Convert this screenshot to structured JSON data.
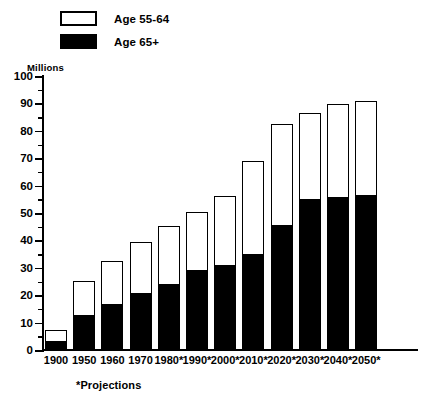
{
  "chart_data": {
    "type": "bar",
    "stacked": true,
    "title": "",
    "subtitle": "",
    "xlabel": "",
    "ylabel": "Millions",
    "ylim": [
      0,
      100
    ],
    "ytick_step": 10,
    "yminor_step": 5,
    "grid": false,
    "legend_position": "top-left",
    "footnote": "*Projections",
    "categories": [
      "1900",
      "1950",
      "1960",
      "1970",
      "1980*",
      "1990*",
      "2000*",
      "2010*",
      "2020*",
      "2030*",
      "2040*",
      "2050*"
    ],
    "series": [
      {
        "name": "Age 65+",
        "color": "#000000",
        "values": [
          3,
          12.5,
          16.5,
          20.5,
          24,
          29,
          31,
          35,
          45.5,
          55,
          55.5,
          56.5
        ]
      },
      {
        "name": "Age 55-64",
        "color": "#ffffff",
        "values": [
          4,
          12.5,
          15.5,
          18.5,
          21,
          21,
          25,
          33.5,
          36.5,
          31,
          34,
          34
        ]
      }
    ],
    "totals": [
      7,
      25,
      32,
      39,
      45,
      50,
      56,
      68.5,
      82,
      86,
      89.5,
      90.5
    ],
    "ytick_labels": [
      "0",
      "10",
      "20",
      "30",
      "40",
      "50",
      "60",
      "70",
      "80",
      "90",
      "100"
    ]
  },
  "legend": {
    "items": [
      {
        "label": "Age 55-64",
        "style": "hollow"
      },
      {
        "label": "Age 65+",
        "style": "filled"
      }
    ]
  },
  "axis": {
    "units_label": "Millions"
  }
}
